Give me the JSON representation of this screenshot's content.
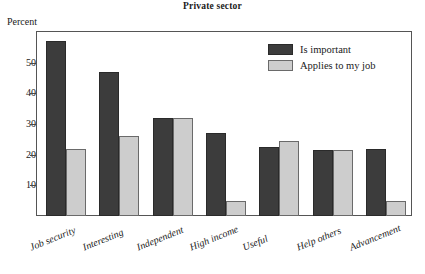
{
  "chart_data": {
    "type": "bar",
    "title": "Private sector",
    "xlabel": "",
    "ylabel": "Percent",
    "ylim": [
      0,
      60
    ],
    "yticks": [
      10,
      20,
      30,
      40,
      50
    ],
    "grid": false,
    "legend_position": "top-right",
    "categories": [
      "Job security",
      "Interesting",
      "Independent",
      "High income",
      "Useful",
      "Help others",
      "Advancement"
    ],
    "series": [
      {
        "name": "Is important",
        "color": "#3c3c3c",
        "values": [
          57,
          47,
          32,
          27,
          22.5,
          21.5,
          22
        ]
      },
      {
        "name": "Applies to my job",
        "color": "#cdcdcd",
        "values": [
          22,
          26,
          32,
          5,
          24.5,
          21.5,
          5
        ]
      }
    ]
  },
  "colors": {
    "is_important": "#3c3c3c",
    "applies_to_my_job": "#cdcdcd",
    "frame": "#555555",
    "text": "#1a1a1a",
    "background": "#ffffff"
  }
}
